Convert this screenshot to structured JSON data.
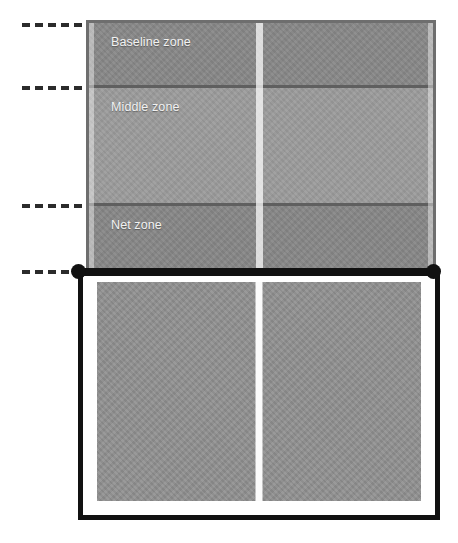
{
  "diagram": {
    "canvas": {
      "width": 458,
      "height": 543,
      "background": "#ffffff"
    }
  },
  "zones": [
    {
      "id": "baseline",
      "label": "Baseline zone",
      "color": "#888888",
      "top": 20,
      "height": 65
    },
    {
      "id": "middle",
      "label": "Middle zone",
      "color": "#9c9c9c",
      "top": 85,
      "height": 118
    },
    {
      "id": "net",
      "label": "Net zone",
      "color": "#878787",
      "top": 203,
      "height": 63
    }
  ],
  "ticks": [
    {
      "id": "tick-far-baseline",
      "y": 23
    },
    {
      "id": "tick-baseline-middle",
      "y": 86
    },
    {
      "id": "tick-middle-net",
      "y": 204
    },
    {
      "id": "tick-net-line",
      "y": 270
    }
  ],
  "net": {
    "color": "#111111",
    "left": 78,
    "right": 434,
    "y": 271,
    "post_left_x": 78,
    "post_right_x": 433
  },
  "courts": {
    "far": {
      "name": "Far court",
      "border_color": "#6e6e6e",
      "center_line_color": "#ffffff"
    },
    "near": {
      "name": "Near court",
      "border_color": "#111111",
      "surface_color": "#919191",
      "center_line_color": "#fbfbfb"
    }
  }
}
